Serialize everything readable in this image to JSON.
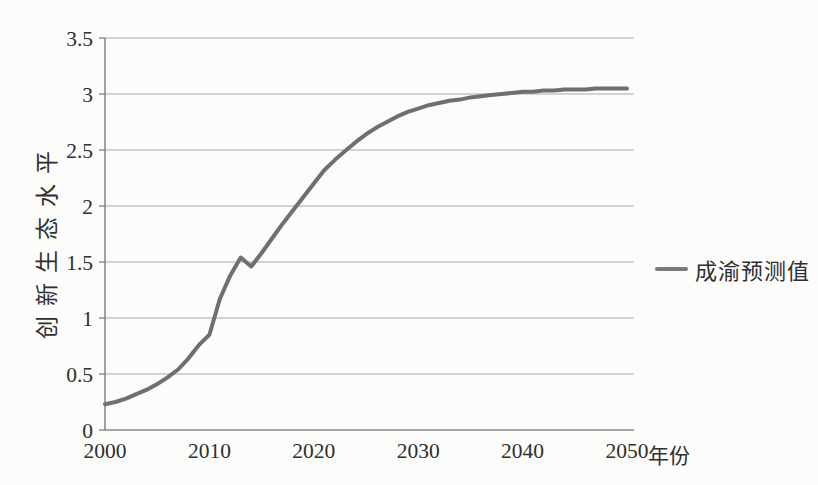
{
  "page": {
    "background": "#fcfcfa"
  },
  "colors": {
    "line": "#6f6f6f",
    "grid": "#a8a8a8",
    "axis": "#8a8a8a",
    "text": "#2f2f2f",
    "legend_marker": "#7a7a7a"
  },
  "legend": {
    "label": "成渝预测值",
    "position": "right"
  },
  "chart_data": {
    "type": "line",
    "title": "",
    "xlabel": "年份",
    "ylabel": "创新生态水平",
    "xlim": [
      2000,
      2050
    ],
    "ylim": [
      0,
      3.5
    ],
    "x_ticks": [
      2000,
      2010,
      2020,
      2030,
      2040,
      2050
    ],
    "y_ticks": [
      0,
      0.5,
      1,
      1.5,
      2,
      2.5,
      3,
      3.5
    ],
    "grid": "horizontal",
    "legend_position": "right",
    "series": [
      {
        "name": "成渝预测值",
        "color": "#6f6f6f",
        "x": [
          2000,
          2001,
          2002,
          2003,
          2004,
          2005,
          2006,
          2007,
          2008,
          2009,
          2010,
          2011,
          2012,
          2013,
          2014,
          2015,
          2016,
          2017,
          2018,
          2019,
          2020,
          2021,
          2022,
          2023,
          2024,
          2025,
          2026,
          2027,
          2028,
          2029,
          2030,
          2031,
          2032,
          2033,
          2034,
          2035,
          2036,
          2037,
          2038,
          2039,
          2040,
          2041,
          2042,
          2043,
          2044,
          2045,
          2046,
          2047,
          2048,
          2049,
          2050
        ],
        "values": [
          0.23,
          0.25,
          0.28,
          0.32,
          0.36,
          0.41,
          0.47,
          0.54,
          0.64,
          0.76,
          0.85,
          1.17,
          1.38,
          1.54,
          1.46,
          1.58,
          1.71,
          1.84,
          1.96,
          2.08,
          2.2,
          2.32,
          2.41,
          2.49,
          2.57,
          2.64,
          2.7,
          2.75,
          2.8,
          2.84,
          2.87,
          2.9,
          2.92,
          2.94,
          2.95,
          2.97,
          2.98,
          2.99,
          3.0,
          3.01,
          3.02,
          3.02,
          3.03,
          3.03,
          3.04,
          3.04,
          3.04,
          3.05,
          3.05,
          3.05,
          3.05
        ]
      }
    ]
  }
}
